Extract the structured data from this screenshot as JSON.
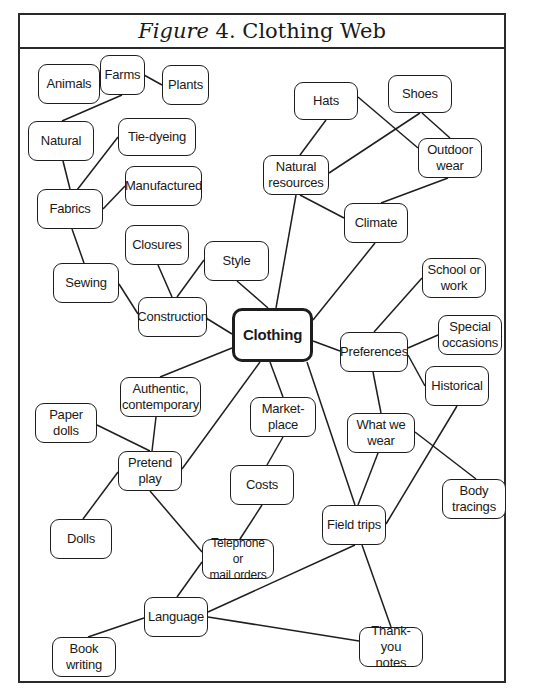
{
  "figure": {
    "label": "Figure",
    "number": "4.",
    "title": "Clothing Web"
  },
  "nodes": {
    "clothing": "Clothing",
    "animals": "Animals",
    "farms": "Farms",
    "plants": "Plants",
    "natural": "Natural",
    "tie_dyeing": "Tie-dyeing",
    "manufactured": "Manufactured",
    "fabrics": "Fabrics",
    "closures": "Closures",
    "style": "Style",
    "sewing": "Sewing",
    "construction": "Construction",
    "hats": "Hats",
    "shoes": "Shoes",
    "outdoor_wear": "Outdoor\nwear",
    "natural_resources": "Natural\nresources",
    "climate": "Climate",
    "school_or_work": "School or\nwork",
    "preferences": "Preferences",
    "special_occasions": "Special\noccasions",
    "historical": "Historical",
    "authentic_contemporary": "Authentic,\ncontemporary",
    "paper_dolls": "Paper\ndolls",
    "marketplace": "Market-\nplace",
    "what_we_wear": "What we\nwear",
    "pretend_play": "Pretend\nplay",
    "costs": "Costs",
    "body_tracings": "Body\ntracings",
    "dolls": "Dolls",
    "field_trips": "Field trips",
    "telephone_mail_orders": "Telephone or\nmail orders",
    "language": "Language",
    "book_writing": "Book\nwriting",
    "thank_you_notes": "Thank-you\nnotes"
  },
  "edges": [
    [
      "Animals",
      "Farms"
    ],
    [
      "Farms",
      "Plants"
    ],
    [
      "Farms",
      "Natural"
    ],
    [
      "Natural",
      "Fabrics"
    ],
    [
      "Fabrics",
      "Tie-dyeing"
    ],
    [
      "Fabrics",
      "Manufactured"
    ],
    [
      "Fabrics",
      "Sewing"
    ],
    [
      "Sewing",
      "Construction"
    ],
    [
      "Closures",
      "Construction"
    ],
    [
      "Style",
      "Construction"
    ],
    [
      "Construction",
      "Clothing"
    ],
    [
      "Style",
      "Clothing"
    ],
    [
      "Natural resources",
      "Clothing"
    ],
    [
      "Hats",
      "Natural resources"
    ],
    [
      "Hats",
      "Outdoor wear"
    ],
    [
      "Shoes",
      "Natural resources"
    ],
    [
      "Shoes",
      "Outdoor wear"
    ],
    [
      "Outdoor wear",
      "Climate"
    ],
    [
      "Natural resources",
      "Climate"
    ],
    [
      "Climate",
      "Clothing"
    ],
    [
      "Clothing",
      "Preferences"
    ],
    [
      "Preferences",
      "School or work"
    ],
    [
      "Preferences",
      "Special occasions"
    ],
    [
      "Preferences",
      "Historical"
    ],
    [
      "Preferences",
      "What we wear"
    ],
    [
      "Clothing",
      "Authentic, contemporary"
    ],
    [
      "Clothing",
      "Market-place"
    ],
    [
      "Clothing",
      "Pretend play"
    ],
    [
      "Clothing",
      "Field trips"
    ],
    [
      "Authentic, contemporary",
      "Pretend play"
    ],
    [
      "Paper dolls",
      "Pretend play"
    ],
    [
      "Pretend play",
      "Dolls"
    ],
    [
      "Pretend play",
      "Telephone or mail orders"
    ],
    [
      "Market-place",
      "Costs"
    ],
    [
      "Costs",
      "Telephone or mail orders"
    ],
    [
      "What we wear",
      "Field trips"
    ],
    [
      "What we wear",
      "Body tracings"
    ],
    [
      "Historical",
      "Field trips"
    ],
    [
      "Field trips",
      "Language"
    ],
    [
      "Field trips",
      "Thank-you notes"
    ],
    [
      "Telephone or mail orders",
      "Language"
    ],
    [
      "Language",
      "Book writing"
    ],
    [
      "Language",
      "Thank-you notes"
    ]
  ]
}
